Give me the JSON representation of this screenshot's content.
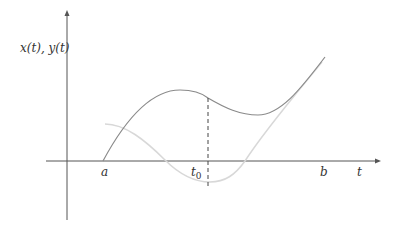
{
  "labels": {
    "y_axis": "x(t), y(t)",
    "x_axis": "t",
    "a": "a",
    "b": "b",
    "t0_base": "t",
    "t0_sub": "0"
  },
  "colors": {
    "axis": "#555555",
    "curve_x": "#8a8a8a",
    "curve_y": "#d8d8d8",
    "dashed": "#444444"
  },
  "curves": [
    {
      "name": "x(t)",
      "description": "starts at a on the axis, rises to a local maximum, dips to a local minimum after t0, rises to b"
    },
    {
      "name": "y(t)",
      "description": "starts above axis near a, descends below axis to a minimum at t0, rises crossing axis and ends near x(t) at b"
    }
  ],
  "marker": {
    "name": "t0",
    "style": "dashed vertical line from x(t0) down to y(t0)"
  }
}
